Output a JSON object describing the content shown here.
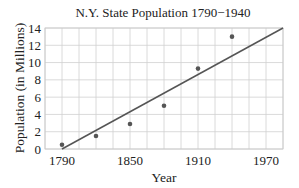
{
  "chart_data": {
    "type": "scatter",
    "title": "N.Y. State Population 1790−1940",
    "xlabel": "Year",
    "ylabel": "Population (in Millions)",
    "xlim": [
      1775,
      1985
    ],
    "ylim": [
      0,
      14
    ],
    "x_grid_step": 15,
    "y_grid_step": 2,
    "grid": true,
    "x_ticks": [
      1790,
      1850,
      1910,
      1970
    ],
    "x_tick_labels": [
      "1790",
      "1850",
      "1910",
      "1970"
    ],
    "y_ticks": [
      0,
      2,
      4,
      6,
      8,
      10,
      12,
      14
    ],
    "y_tick_labels": [
      "0",
      "2",
      "4",
      "6",
      "8",
      "10",
      "12",
      "14"
    ],
    "series": [
      {
        "name": "Population",
        "kind": "points",
        "x": [
          1790,
          1820,
          1850,
          1880,
          1910,
          1940
        ],
        "y": [
          0.5,
          1.5,
          2.9,
          5.0,
          9.3,
          13.0
        ]
      },
      {
        "name": "Linear fit",
        "kind": "line",
        "x": [
          1790,
          1985
        ],
        "y": [
          0.0,
          14.0
        ]
      }
    ],
    "legend": null
  },
  "colors": {
    "points": "#555555",
    "line": "#555555",
    "grid": "#d0d0d0",
    "text": "#222222"
  }
}
